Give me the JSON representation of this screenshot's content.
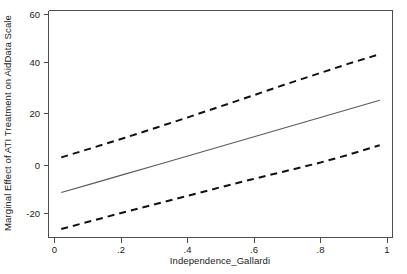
{
  "figure": {
    "background_color": "#ffffff",
    "axis_color": "#4d4d4d",
    "estimate_color": "#5a5a5a",
    "ci_color": "#111111",
    "caption": ""
  },
  "chart_data": {
    "type": "line",
    "title": "",
    "subtitle": "",
    "xlabel": "Independence_Gallardi",
    "ylabel": "Marginal Effect of ATI Treatment on AidData Scale",
    "xlim": [
      -0.04,
      1.04
    ],
    "ylim": [
      -27.5,
      66.0
    ],
    "xticks": [
      0,
      0.2,
      0.4,
      0.6,
      0.8,
      1
    ],
    "xticklabels": [
      "0",
      ".2",
      ".4",
      ".6",
      ".8",
      "1"
    ],
    "yticks": [
      -20,
      0,
      20,
      40,
      60
    ],
    "yticklabels": [
      "-20",
      "0",
      "20",
      "40",
      "60"
    ],
    "grid": false,
    "legend": "none",
    "x": [
      0,
      0.1,
      0.2,
      0.3,
      0.4,
      0.5,
      0.6,
      0.7,
      0.8,
      0.9,
      1
    ],
    "series": [
      {
        "name": "Marginal effect",
        "style": "solid",
        "color": "#5a5a5a",
        "values": [
          -9.0,
          -5.2,
          -1.4,
          2.4,
          6.2,
          10.0,
          13.8,
          17.6,
          21.4,
          25.2,
          29.0
        ]
      },
      {
        "name": "Upper 95% confidence bound",
        "style": "dashed",
        "color": "#111111",
        "values": [
          5.5,
          9.5,
          13.6,
          17.8,
          22.1,
          26.5,
          30.9,
          35.4,
          39.7,
          44.0,
          48.0
        ]
      },
      {
        "name": "Lower 95% confidence bound",
        "style": "dashed",
        "color": "#111111",
        "values": [
          -24.0,
          -20.5,
          -17.0,
          -13.6,
          -10.2,
          -6.8,
          -3.5,
          -0.3,
          2.9,
          6.5,
          10.5
        ]
      }
    ]
  }
}
